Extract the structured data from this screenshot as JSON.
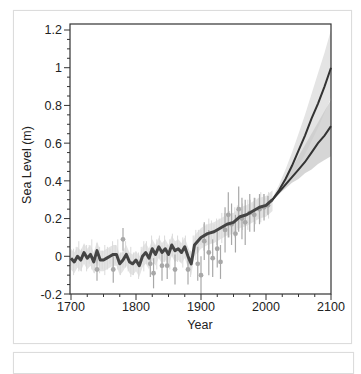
{
  "chart_data": {
    "type": "line",
    "title": "",
    "xlabel": "Year",
    "ylabel": "Sea Level (m)",
    "xlim": [
      1700,
      2100
    ],
    "ylim": [
      -0.2,
      1.2
    ],
    "xticks": [
      1700,
      1800,
      1900,
      2000,
      2100
    ],
    "xtick_labels": [
      "1700",
      "1800",
      "1900",
      "2000",
      "2100"
    ],
    "yticks": [
      -0.2,
      0,
      0.2,
      0.4,
      0.6,
      0.8,
      1,
      1.2
    ],
    "ytick_labels": [
      "-0.2",
      "0",
      "0.2",
      "0.4",
      "0.6",
      "0.8",
      "1",
      "1.2"
    ],
    "grid": false,
    "legend": null,
    "series": [
      {
        "name": "Reconstructed sea level (mean)",
        "style": "thick dark line with light gray uncertainty band",
        "color": "#444444",
        "x": [
          1700,
          1705,
          1710,
          1715,
          1720,
          1725,
          1730,
          1735,
          1740,
          1745,
          1750,
          1755,
          1760,
          1765,
          1770,
          1775,
          1780,
          1785,
          1790,
          1795,
          1800,
          1805,
          1810,
          1815,
          1820,
          1825,
          1830,
          1835,
          1840,
          1845,
          1850,
          1855,
          1860,
          1865,
          1870,
          1875,
          1880,
          1885,
          1890,
          1895,
          1900,
          1910,
          1920,
          1930,
          1940,
          1950,
          1960,
          1970,
          1980,
          1990,
          2000,
          2010
        ],
        "y": [
          -0.01,
          -0.03,
          0.0,
          -0.02,
          0.02,
          -0.01,
          0.01,
          -0.03,
          0.03,
          -0.02,
          -0.02,
          -0.01,
          0.0,
          0.01,
          0.01,
          -0.04,
          -0.02,
          0.01,
          -0.03,
          -0.04,
          -0.02,
          -0.05,
          0.0,
          0.02,
          -0.01,
          0.04,
          0.01,
          0.05,
          0.02,
          0.04,
          0.01,
          0.06,
          0.03,
          0.04,
          0.02,
          0.05,
          0.0,
          -0.04,
          0.06,
          0.08,
          0.1,
          0.12,
          0.13,
          0.15,
          0.17,
          0.18,
          0.21,
          0.22,
          0.24,
          0.26,
          0.27,
          0.3
        ]
      },
      {
        "name": "Proxy / tide-gauge data points",
        "style": "gray markers with vertical error bars",
        "color": "#a8a8a8",
        "points": [
          {
            "x": 1740,
            "y": -0.07,
            "err": 0.06
          },
          {
            "x": 1765,
            "y": -0.07,
            "err": 0.07
          },
          {
            "x": 1780,
            "y": 0.09,
            "err": 0.06
          },
          {
            "x": 1822,
            "y": -0.04,
            "err": 0.07
          },
          {
            "x": 1827,
            "y": -0.09,
            "err": 0.08
          },
          {
            "x": 1840,
            "y": -0.05,
            "err": 0.08
          },
          {
            "x": 1848,
            "y": -0.05,
            "err": 0.07
          },
          {
            "x": 1860,
            "y": -0.07,
            "err": 0.08
          },
          {
            "x": 1880,
            "y": -0.07,
            "err": 0.08
          },
          {
            "x": 1895,
            "y": -0.04,
            "err": 0.09
          },
          {
            "x": 1900,
            "y": -0.1,
            "err": 0.1
          },
          {
            "x": 1905,
            "y": 0.08,
            "err": 0.1
          },
          {
            "x": 1912,
            "y": 0.02,
            "err": 0.12
          },
          {
            "x": 1918,
            "y": -0.01,
            "err": 0.1
          },
          {
            "x": 1925,
            "y": 0.04,
            "err": 0.1
          },
          {
            "x": 1930,
            "y": -0.03,
            "err": 0.09
          },
          {
            "x": 1937,
            "y": 0.14,
            "err": 0.12
          },
          {
            "x": 1942,
            "y": 0.22,
            "err": 0.12
          },
          {
            "x": 1947,
            "y": 0.17,
            "err": 0.11
          },
          {
            "x": 1953,
            "y": 0.12,
            "err": 0.1
          },
          {
            "x": 1958,
            "y": 0.25,
            "err": 0.12
          },
          {
            "x": 1963,
            "y": 0.2,
            "err": 0.11
          },
          {
            "x": 1968,
            "y": 0.18,
            "err": 0.12
          },
          {
            "x": 1975,
            "y": 0.23,
            "err": 0.1
          },
          {
            "x": 1982,
            "y": 0.22,
            "err": 0.09
          },
          {
            "x": 1990,
            "y": 0.25,
            "err": 0.08
          },
          {
            "x": 1997,
            "y": 0.26,
            "err": 0.07
          },
          {
            "x": 2003,
            "y": 0.27,
            "err": 0.05
          }
        ]
      },
      {
        "name": "Projection (high)",
        "style": "dark line with gray uncertainty band",
        "color": "#333333",
        "x": [
          2010,
          2020,
          2030,
          2040,
          2050,
          2060,
          2070,
          2080,
          2090,
          2100
        ],
        "y": [
          0.3,
          0.35,
          0.41,
          0.48,
          0.56,
          0.64,
          0.73,
          0.81,
          0.9,
          1.0
        ],
        "band_upper": [
          0.31,
          0.38,
          0.46,
          0.55,
          0.65,
          0.75,
          0.86,
          0.97,
          1.08,
          1.2
        ],
        "band_lower": [
          0.29,
          0.33,
          0.37,
          0.42,
          0.48,
          0.54,
          0.61,
          0.68,
          0.76,
          0.84
        ]
      },
      {
        "name": "Projection (low)",
        "style": "dark line with gray uncertainty band",
        "color": "#333333",
        "x": [
          2010,
          2020,
          2030,
          2040,
          2050,
          2060,
          2070,
          2080,
          2090,
          2100
        ],
        "y": [
          0.3,
          0.34,
          0.38,
          0.42,
          0.46,
          0.5,
          0.55,
          0.6,
          0.64,
          0.69
        ],
        "band_upper": [
          0.31,
          0.35,
          0.41,
          0.47,
          0.53,
          0.59,
          0.65,
          0.71,
          0.77,
          0.83
        ],
        "band_lower": [
          0.29,
          0.33,
          0.36,
          0.39,
          0.41,
          0.44,
          0.46,
          0.49,
          0.51,
          0.53
        ]
      }
    ]
  },
  "labels": {
    "xlabel": "Year",
    "ylabel": "Sea Level (m)",
    "xticks": [
      "1700",
      "1800",
      "1900",
      "2000",
      "2100"
    ],
    "yticks": [
      "1.2",
      "1",
      "0.8",
      "0.6",
      "0.4",
      "0.2",
      "0",
      "-0.2"
    ]
  },
  "colors": {
    "axis": "#333333",
    "mean_line": "#444444",
    "band_light": "#e4e4e4",
    "band_mid": "#c8c8c8",
    "points": "#a8a8a8"
  }
}
